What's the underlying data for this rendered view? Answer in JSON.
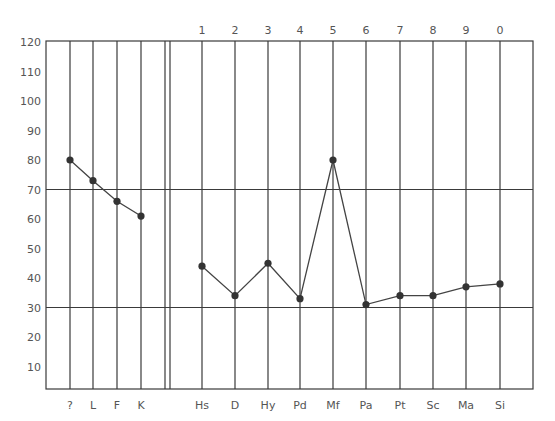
{
  "chart_data": {
    "type": "line",
    "title": "",
    "xlabel": "",
    "ylabel": "",
    "ylim": [
      0,
      120
    ],
    "y_ticks": [
      10,
      20,
      30,
      40,
      50,
      60,
      70,
      80,
      90,
      100,
      110,
      120
    ],
    "reference_lines": [
      70,
      30
    ],
    "grid": "vertical lines at each scale, horizontal lines at 30 and 70",
    "legend": null,
    "series": [
      {
        "name": "Validity scales",
        "categories": [
          "?",
          "L",
          "F",
          "K"
        ],
        "values": [
          80,
          73,
          66,
          61
        ]
      },
      {
        "name": "Clinical scales",
        "categories": [
          "Hs",
          "D",
          "Hy",
          "Pd",
          "Mf",
          "Pa",
          "Pt",
          "Sc",
          "Ma",
          "Si"
        ],
        "top_labels": [
          "1",
          "2",
          "3",
          "4",
          "5",
          "6",
          "7",
          "8",
          "9",
          "0"
        ],
        "values": [
          44,
          34,
          45,
          33,
          80,
          31,
          34,
          34,
          37,
          38
        ]
      }
    ]
  }
}
